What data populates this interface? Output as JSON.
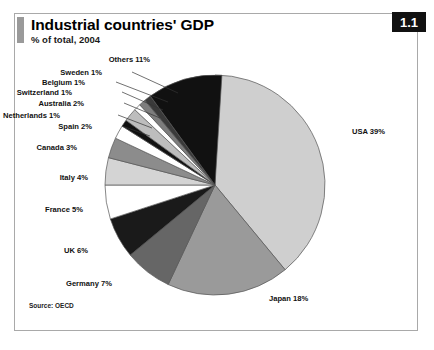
{
  "panel": {
    "title": "Industrial countries' GDP",
    "subtitle": "% of total, 2004",
    "badge": "1.1",
    "source": "Source: OECD"
  },
  "chart_data": {
    "type": "pie",
    "title": "Industrial countries' GDP",
    "subtitle": "% of total, 2004",
    "unit": "% of total",
    "year": 2004,
    "source": "Source: OECD",
    "legend": "none",
    "grid": false,
    "start_angle_deg": 0,
    "direction": "clockwise",
    "total": 100,
    "categories": [
      "USA",
      "Japan",
      "Germany",
      "UK",
      "France",
      "Italy",
      "Canada",
      "Spain",
      "Netherlands",
      "Australia",
      "Switzerland",
      "Belgium",
      "Sweden",
      "Others"
    ],
    "values": [
      39,
      18,
      7,
      6,
      5,
      4,
      3,
      2,
      1,
      2,
      1,
      1,
      1,
      11
    ],
    "slices": [
      {
        "name": "USA",
        "value": 39,
        "label": "USA 39%",
        "color": "#cfcfcf",
        "label_x": 352,
        "label_y": 134,
        "placement": "outside"
      },
      {
        "name": "Japan",
        "value": 18,
        "label": "Japan 18%",
        "color": "#9a9a9a",
        "label_x": 269,
        "label_y": 301,
        "placement": "outside"
      },
      {
        "name": "Germany",
        "value": 7,
        "label": "Germany 7%",
        "color": "#666666",
        "label_x": 112,
        "label_y": 286,
        "placement": "outside"
      },
      {
        "name": "UK",
        "value": 6,
        "label": "UK 6%",
        "color": "#1a1a1a",
        "label_x": 88,
        "label_y": 253,
        "placement": "outside"
      },
      {
        "name": "France",
        "value": 5,
        "label": "France 5%",
        "color": "#ffffff",
        "label_x": 83,
        "label_y": 212,
        "placement": "outside"
      },
      {
        "name": "Italy",
        "value": 4,
        "label": "Italy 4%",
        "color": "#d4d4d4",
        "label_x": 88,
        "label_y": 180,
        "placement": "outside"
      },
      {
        "name": "Canada",
        "value": 3,
        "label": "Canada 3%",
        "color": "#8c8c8c",
        "label_x": 77,
        "label_y": 150,
        "placement": "outside"
      },
      {
        "name": "Spain",
        "value": 2,
        "label": "Spain 2%",
        "color": "#ffffff",
        "label_x": 92,
        "label_y": 129,
        "placement": "outside"
      },
      {
        "name": "Netherlands",
        "value": 1,
        "label": "Netherlands 1%",
        "color": "#111111",
        "label_x": 60,
        "label_y": 118,
        "placement": "outside"
      },
      {
        "name": "Australia",
        "value": 2,
        "label": "Australia 2%",
        "color": "#bdbdbd",
        "label_x": 84,
        "label_y": 106,
        "placement": "outside"
      },
      {
        "name": "Switzerland",
        "value": 1,
        "label": "Switzerland 1%",
        "color": "#ffffff",
        "label_x": 72,
        "label_y": 95,
        "placement": "outside"
      },
      {
        "name": "Belgium",
        "value": 1,
        "label": "Belgium 1%",
        "color": "#7d7d7d",
        "label_x": 85,
        "label_y": 85,
        "placement": "outside"
      },
      {
        "name": "Sweden",
        "value": 1,
        "label": "Sweden 1%",
        "color": "#3a3a3a",
        "label_x": 102,
        "label_y": 75,
        "placement": "outside"
      },
      {
        "name": "Others",
        "value": 11,
        "label": "Others 11%",
        "color": "#111111",
        "label_x": 150,
        "label_y": 62,
        "placement": "outside"
      }
    ],
    "geometry": {
      "cx": 215,
      "cy": 185,
      "r": 110
    },
    "leaders": [
      {
        "name": "Sweden",
        "x1": 132,
        "y1": 72,
        "x2": 178,
        "y2": 93
      },
      {
        "name": "Belgium",
        "x1": 116,
        "y1": 82,
        "x2": 168,
        "y2": 102
      },
      {
        "name": "Switzerland",
        "x1": 122,
        "y1": 92,
        "x2": 163,
        "y2": 110
      },
      {
        "name": "Australia",
        "x1": 124,
        "y1": 103,
        "x2": 160,
        "y2": 118
      },
      {
        "name": "Netherlands",
        "x1": 118,
        "y1": 115,
        "x2": 152,
        "y2": 128
      },
      {
        "name": "Spain",
        "x1": 122,
        "y1": 126,
        "x2": 150,
        "y2": 136
      }
    ]
  }
}
